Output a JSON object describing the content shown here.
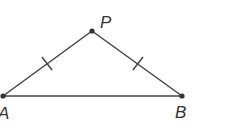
{
  "diagram": {
    "type": "isosceles-triangle",
    "points": {
      "A": {
        "label": "A",
        "x": 3,
        "y": 96
      },
      "P": {
        "label": "P",
        "x": 92,
        "y": 31
      },
      "B": {
        "label": "B",
        "x": 182,
        "y": 96
      }
    },
    "segments": [
      {
        "from": "A",
        "to": "P",
        "tick_marks": 1
      },
      {
        "from": "P",
        "to": "B",
        "tick_marks": 1
      },
      {
        "from": "A",
        "to": "B",
        "tick_marks": 0
      }
    ],
    "congruent_sides": [
      "AP",
      "PB"
    ],
    "colors": {
      "line": "#444444",
      "point": "#333333",
      "label": "#333333"
    }
  }
}
